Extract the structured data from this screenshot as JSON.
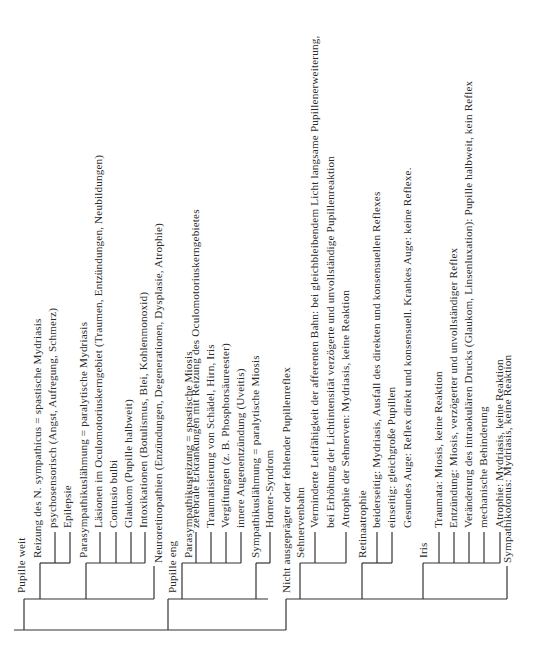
{
  "diagram": {
    "orientation": "rotated-90-ccw",
    "line_color": "#333333",
    "nodes": [
      {
        "id": "n1",
        "level": 1,
        "text": "Pupille weit",
        "x": 21,
        "y": 593
      },
      {
        "id": "n2",
        "level": 2,
        "text": "Reizung des N. sympathicus = spastische Mydriasis",
        "x": 37,
        "y": 558
      },
      {
        "id": "n3",
        "level": 3,
        "text": "psychosensorisch (Angst, Aufregung, Schmerz)",
        "x": 52,
        "y": 528
      },
      {
        "id": "n4",
        "level": 3,
        "text": "Epilepsie",
        "x": 67,
        "y": 528
      },
      {
        "id": "n5",
        "level": 2,
        "text": "Parasympathikuslähmung = paralytische Mydriasis",
        "x": 83,
        "y": 558
      },
      {
        "id": "n6",
        "level": 3,
        "text": "Läsionen im Oculomotoriuskerngebiet (Traumen, Entzündungen, Neubildungen)",
        "x": 98,
        "y": 528
      },
      {
        "id": "n7",
        "level": 3,
        "text": "Contusio bulbi",
        "x": 113,
        "y": 528
      },
      {
        "id": "n8",
        "level": 3,
        "text": "Glaukom (Pupille halbweit)",
        "x": 128,
        "y": 528
      },
      {
        "id": "n9",
        "level": 3,
        "text": "Intoxikationen (Botulismus, Blei, Kohlenmonoxid)",
        "x": 143,
        "y": 528
      },
      {
        "id": "n10",
        "level": 2,
        "text": "Neuroretinopathien (Enzündungen, Degenerationen, Dysplasie, Atrophie)",
        "x": 158,
        "y": 563
      },
      {
        "id": "n11",
        "level": 1,
        "text": "Pupille eng",
        "x": 172,
        "y": 593
      },
      {
        "id": "n12",
        "level": 2,
        "text": "Parasympathikusreizung = spastische Miosis",
        "x": 188,
        "y": 558
      },
      {
        "id": "n13",
        "level": 3,
        "text": "zerebrale Erkrankungen mit Reizung des Oculomotoriuskerngebietes",
        "x": 204,
        "y": 528
      },
      {
        "id": "n14",
        "level": 3,
        "text": "Traumatisierung von Schädel, Hirn, Iris",
        "x": 219,
        "y": 528
      },
      {
        "id": "n15",
        "level": 3,
        "text": "Vergiftungen (z. B. Phosphorsäureester)",
        "x": 234,
        "y": 528
      },
      {
        "id": "n16",
        "level": 3,
        "text": "innere Augenentzündung (Uveitis)",
        "x": 249,
        "y": 528
      },
      {
        "id": "n17",
        "level": 2,
        "text": "Sympathikuslähmung = paralytische Miosis",
        "x": 265,
        "y": 558
      },
      {
        "id": "n18",
        "level": 3,
        "text": "Horner-Syndrom",
        "x": 280,
        "y": 528
      },
      {
        "id": "n19",
        "level": 1,
        "text": "Nicht ausgeprägter oder fehlender Pupillenreflex",
        "x": 295,
        "y": 593
      },
      {
        "id": "n20",
        "level": 2,
        "text": "Sehnervenbahn",
        "x": 311,
        "y": 558
      },
      {
        "id": "n21",
        "level": 3,
        "text": "Verminderte Leitfähigkeit der afferenten Bahn: bei gleichbleibendem Licht langsame Pupillenerweiterung,",
        "x": 326,
        "y": 528
      },
      {
        "id": "n22",
        "level": 3,
        "text": "bei Erhöhung der Lichtintensität verzögerte und unvollständige Pupillenreaktion",
        "x": 341,
        "y": 528
      },
      {
        "id": "n23",
        "level": 3,
        "text": "Atrophie der Sehnerven: Mydriasis, keine Reaktion",
        "x": 356,
        "y": 528
      },
      {
        "id": "n24",
        "level": 2,
        "text": "Retinaatrophie",
        "x": 372,
        "y": 558
      },
      {
        "id": "n25",
        "level": 3,
        "text": "beiderseitig: Mydriasis, Ausfall des direkten und konsensuellen Reflexes",
        "x": 388,
        "y": 528
      },
      {
        "id": "n26",
        "level": 3,
        "text": "einseitig: gleichgroße Pupillen",
        "x": 403,
        "y": 528
      },
      {
        "id": "n27",
        "level": 3,
        "text": "Gesundes Auge: Reflex direkt und konsensuell. Krankes Auge: keine Reflexe.",
        "x": 418,
        "y": 528
      },
      {
        "id": "n28",
        "level": 2,
        "text": "Iris",
        "x": 433,
        "y": 558
      },
      {
        "id": "n29",
        "level": 3,
        "text": "Traumata: Miosis, keine Reaktion",
        "x": 450,
        "y": 528
      },
      {
        "id": "n30",
        "level": 3,
        "text": "Entzündung: Miosis, verzögerter und unvollständiger Reflex",
        "x": 465,
        "y": 528
      },
      {
        "id": "n31",
        "level": 3,
        "text": "Veränderung des intraokulären Drucks (Glaukom, Linsenluxation): Pupille halbweit, kein Reflex",
        "x": 480,
        "y": 528
      },
      {
        "id": "n32",
        "level": 3,
        "text": "mechanische Behinderung",
        "x": 496,
        "y": 528
      },
      {
        "id": "n33",
        "level": 3,
        "text": "Atrophie: Mydriasis, keine Reaktion",
        "x": 511,
        "y": 528
      },
      {
        "id": "n34",
        "level": 2,
        "text": "Sympathikotonus: Mydriasis, keine Reaktion",
        "x": 527,
        "y": 563
      }
    ]
  }
}
